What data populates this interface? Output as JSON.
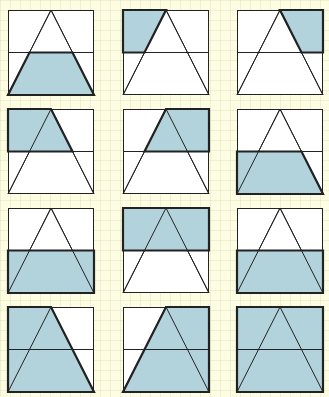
{
  "diagram": {
    "colors": {
      "background": "#fdfde4",
      "shade": "#b3d3dc",
      "line": "#222222",
      "box_fill": "#ffffff"
    },
    "layout": {
      "columns_x": [
        8,
        123,
        237
      ],
      "rows_y": [
        10,
        109,
        208,
        307
      ],
      "box_width": 86,
      "box_height": 85
    },
    "cells": [
      {
        "id": 1,
        "row": 0,
        "col": 0,
        "description": "bottom trapezoid inside triangle shaded",
        "shade": [
          [
            0.25,
            0.5
          ],
          [
            0.75,
            0.5
          ],
          [
            1,
            1
          ],
          [
            0,
            1
          ]
        ]
      },
      {
        "id": 2,
        "row": 0,
        "col": 1,
        "description": "top-left corner outside triangle shaded",
        "shade": [
          [
            0,
            0
          ],
          [
            0.5,
            0
          ],
          [
            0.25,
            0.5
          ],
          [
            0,
            0.5
          ]
        ]
      },
      {
        "id": 3,
        "row": 0,
        "col": 2,
        "description": "top-right corner outside triangle shaded",
        "shade": [
          [
            0.5,
            0
          ],
          [
            1,
            0
          ],
          [
            1,
            0.5
          ],
          [
            0.75,
            0.5
          ]
        ]
      },
      {
        "id": 4,
        "row": 1,
        "col": 0,
        "description": "top half left of triangle right edge shaded",
        "shade": [
          [
            0,
            0
          ],
          [
            0.5,
            0
          ],
          [
            0.75,
            0.5
          ],
          [
            0,
            0.5
          ]
        ]
      },
      {
        "id": 5,
        "row": 1,
        "col": 1,
        "description": "top half right of triangle left edge shaded",
        "shade": [
          [
            0.5,
            0
          ],
          [
            1,
            0
          ],
          [
            1,
            0.5
          ],
          [
            0.25,
            0.5
          ]
        ]
      },
      {
        "id": 6,
        "row": 1,
        "col": 2,
        "description": "bottom half left of triangle right edge shaded",
        "shade": [
          [
            0,
            0.5
          ],
          [
            0.75,
            0.5
          ],
          [
            1,
            1
          ],
          [
            0,
            1
          ]
        ]
      },
      {
        "id": 7,
        "row": 2,
        "col": 0,
        "description": "entire bottom half shaded",
        "shade": [
          [
            0,
            0.5
          ],
          [
            1,
            0.5
          ],
          [
            1,
            1
          ],
          [
            0,
            1
          ]
        ]
      },
      {
        "id": 8,
        "row": 2,
        "col": 1,
        "description": "entire top half shaded",
        "shade": [
          [
            0,
            0
          ],
          [
            1,
            0
          ],
          [
            1,
            0.5
          ],
          [
            0,
            0.5
          ]
        ]
      },
      {
        "id": 9,
        "row": 2,
        "col": 2,
        "description": "entire bottom half shaded",
        "shade": [
          [
            0,
            0.5
          ],
          [
            1,
            0.5
          ],
          [
            1,
            1
          ],
          [
            0,
            1
          ]
        ]
      },
      {
        "id": 10,
        "row": 3,
        "col": 0,
        "description": "full height left of triangle right edge shaded",
        "shade": [
          [
            0,
            0
          ],
          [
            0.5,
            0
          ],
          [
            1,
            1
          ],
          [
            0,
            1
          ]
        ]
      },
      {
        "id": 11,
        "row": 3,
        "col": 1,
        "description": "full height right of triangle left edge shaded",
        "shade": [
          [
            0.5,
            0
          ],
          [
            1,
            0
          ],
          [
            1,
            1
          ],
          [
            0,
            1
          ]
        ]
      },
      {
        "id": 12,
        "row": 3,
        "col": 2,
        "description": "entire square shaded",
        "shade": [
          [
            0,
            0
          ],
          [
            1,
            0
          ],
          [
            1,
            1
          ],
          [
            0,
            1
          ]
        ]
      }
    ]
  }
}
